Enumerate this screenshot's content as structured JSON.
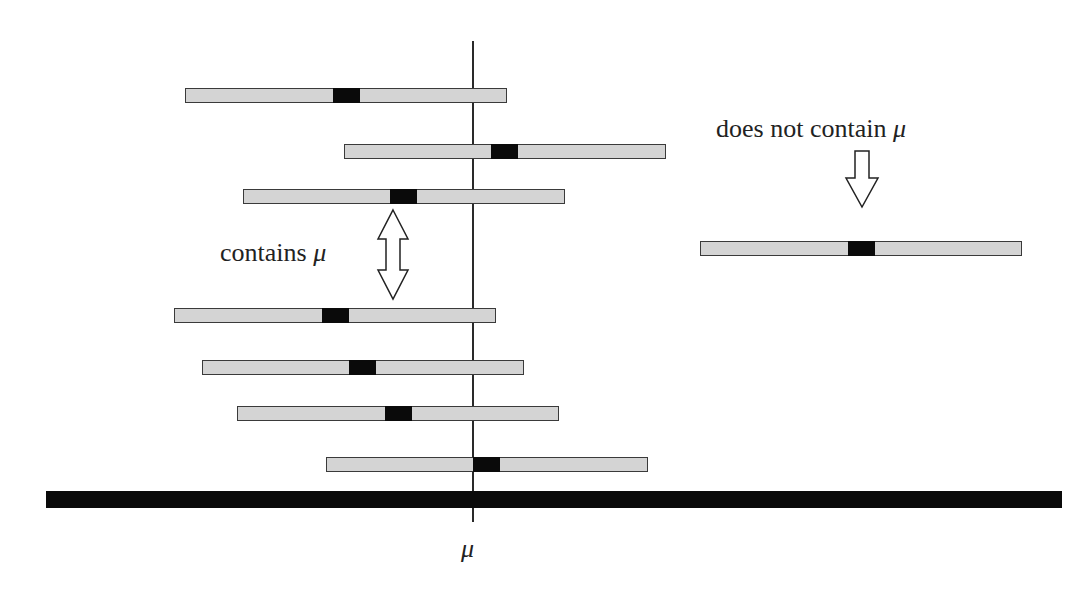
{
  "diagram": {
    "title": "",
    "mu_symbol": "μ",
    "axis_label": "μ",
    "annotations": {
      "contains": {
        "text": "contains",
        "symbol": "μ"
      },
      "does_not_contain": {
        "text": "does not contain",
        "symbol": "μ"
      }
    },
    "colors": {
      "interval_fill": "#d4d4d4",
      "interval_border": "#3a3a3a",
      "point_estimate": "#0a0a0a",
      "axis": "#0a0a0a"
    },
    "intervals": [
      {
        "left": 185,
        "top": 88,
        "marker_left": 333,
        "contains_mu": true
      },
      {
        "left": 344,
        "top": 144,
        "marker_left": 491,
        "contains_mu": true
      },
      {
        "left": 243,
        "top": 189,
        "marker_left": 390,
        "contains_mu": true
      },
      {
        "left": 700,
        "top": 241,
        "marker_left": 848,
        "contains_mu": false
      },
      {
        "left": 174,
        "top": 308,
        "marker_left": 322,
        "contains_mu": true
      },
      {
        "left": 202,
        "top": 360,
        "marker_left": 349,
        "contains_mu": true
      },
      {
        "left": 237,
        "top": 406,
        "marker_left": 385,
        "contains_mu": true
      },
      {
        "left": 326,
        "top": 457,
        "marker_left": 473,
        "contains_mu": true
      }
    ],
    "interval_width": 322,
    "marker_width": 27
  }
}
